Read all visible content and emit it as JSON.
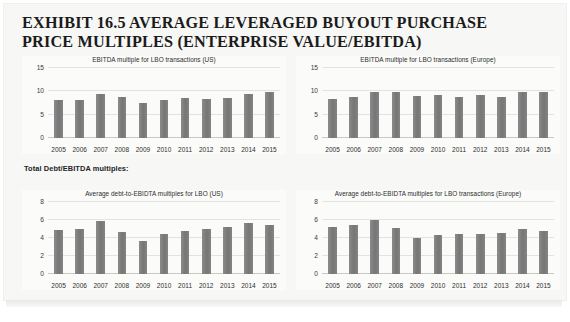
{
  "exhibit": {
    "title_line1": "EXHIBIT 16.5 AVERAGE LEVERAGED BUYOUT PURCHASE",
    "title_line2": "PRICE MULTIPLES (ENTERPRISE VALUE/EBITDA)"
  },
  "section_label": "Total Debt/EBITDA multiples:",
  "chart_data": [
    {
      "id": "ebitda-multiple-us",
      "type": "bar",
      "title": "EBITDA multiple for LBO transactions (US)",
      "categories": [
        "2005",
        "2006",
        "2007",
        "2008",
        "2009",
        "2010",
        "2011",
        "2012",
        "2013",
        "2014",
        "2015"
      ],
      "values": [
        8.2,
        8.2,
        9.4,
        8.8,
        7.5,
        8.2,
        8.6,
        8.4,
        8.5,
        9.5,
        9.8
      ],
      "xlabel": "",
      "ylabel": "",
      "ylim": [
        0,
        15
      ],
      "yticks": [
        0,
        5,
        10,
        15
      ],
      "grid": true,
      "legend": "none"
    },
    {
      "id": "ebitda-multiple-europe",
      "type": "bar",
      "title": "EBITDA multiple for LBO transactions  (Europe)",
      "categories": [
        "2005",
        "2006",
        "2007",
        "2008",
        "2009",
        "2010",
        "2011",
        "2012",
        "2013",
        "2014",
        "2015"
      ],
      "values": [
        8.4,
        8.8,
        9.8,
        9.8,
        8.9,
        9.2,
        8.8,
        9.3,
        8.7,
        9.9,
        9.8
      ],
      "xlabel": "",
      "ylabel": "",
      "ylim": [
        0,
        15
      ],
      "yticks": [
        0,
        5,
        10,
        15
      ],
      "grid": true,
      "legend": "none"
    },
    {
      "id": "debt-ebitda-us",
      "type": "bar",
      "title": "Average debt-to-EBIDTA multiples for LBO  (US)",
      "categories": [
        "2005",
        "2006",
        "2007",
        "2008",
        "2009",
        "2010",
        "2011",
        "2012",
        "2013",
        "2014",
        "2015"
      ],
      "values": [
        4.9,
        5.0,
        5.9,
        4.7,
        3.7,
        4.5,
        4.8,
        5.0,
        5.2,
        5.7,
        5.4
      ],
      "xlabel": "",
      "ylabel": "",
      "ylim": [
        0,
        8
      ],
      "yticks": [
        0,
        2,
        4,
        6,
        8
      ],
      "grid": true,
      "legend": "none"
    },
    {
      "id": "debt-ebitda-europe",
      "type": "bar",
      "title": "Average debt-to-EBIDTA multiples for LBO transactions (Europe)",
      "categories": [
        "2005",
        "2006",
        "2007",
        "2008",
        "2009",
        "2010",
        "2011",
        "2012",
        "2013",
        "2014",
        "2015"
      ],
      "values": [
        5.2,
        5.4,
        6.0,
        5.1,
        4.0,
        4.3,
        4.4,
        4.5,
        4.6,
        5.0,
        4.8
      ],
      "xlabel": "",
      "ylabel": "",
      "ylim": [
        0,
        8
      ],
      "yticks": [
        0,
        2,
        4,
        6,
        8
      ],
      "grid": true,
      "legend": "none"
    }
  ],
  "colors": {
    "bar": "#7d7d7d",
    "page": "#f7f7f5",
    "grid": "#e2e2df",
    "text": "#2b2b2b"
  }
}
